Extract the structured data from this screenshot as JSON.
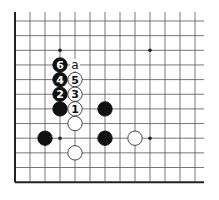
{
  "diagram": {
    "type": "go-board-fragment",
    "grid": {
      "origin_x": 15,
      "origin_y": 21,
      "spacing_x": 15,
      "spacing_y": 14.65,
      "cols": 13,
      "rows": 12,
      "left_edge": true,
      "bottom_edge": true,
      "top_open": true,
      "right_open": true
    },
    "colors": {
      "line": "#555555",
      "edge": "#222222",
      "black": "#111111",
      "white": "#ffffff"
    },
    "star_points": [
      {
        "col": 3,
        "row": 2
      },
      {
        "col": 9,
        "row": 2
      },
      {
        "col": 3,
        "row": 8
      },
      {
        "col": 9,
        "row": 8
      }
    ],
    "stones": [
      {
        "color": "black",
        "col": 3,
        "row": 3,
        "label": "6"
      },
      {
        "color": "black",
        "col": 3,
        "row": 4,
        "label": "4"
      },
      {
        "color": "white",
        "col": 4,
        "row": 4,
        "label": "5"
      },
      {
        "color": "black",
        "col": 3,
        "row": 5,
        "label": "2"
      },
      {
        "color": "white",
        "col": 4,
        "row": 5,
        "label": "3"
      },
      {
        "color": "black",
        "col": 3,
        "row": 6,
        "label": ""
      },
      {
        "color": "white",
        "col": 4,
        "row": 6,
        "label": "1"
      },
      {
        "color": "black",
        "col": 6,
        "row": 6,
        "label": ""
      },
      {
        "color": "white",
        "col": 4,
        "row": 7,
        "label": ""
      },
      {
        "color": "black",
        "col": 2,
        "row": 8,
        "label": ""
      },
      {
        "color": "black",
        "col": 6,
        "row": 8,
        "label": ""
      },
      {
        "color": "white",
        "col": 8,
        "row": 8,
        "label": ""
      },
      {
        "color": "white",
        "col": 4,
        "row": 9,
        "label": ""
      }
    ],
    "markers": [
      {
        "col": 4,
        "row": 3,
        "label": "a"
      }
    ]
  }
}
